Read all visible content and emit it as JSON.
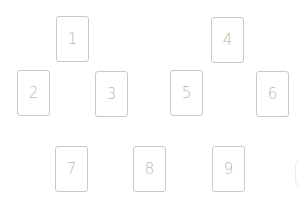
{
  "board": {
    "cards": [
      {
        "label": "1",
        "x": 56,
        "y": 16
      },
      {
        "label": "2",
        "x": 17,
        "y": 70
      },
      {
        "label": "3",
        "x": 95,
        "y": 71
      },
      {
        "label": "4",
        "x": 211,
        "y": 17
      },
      {
        "label": "5",
        "x": 170,
        "y": 70
      },
      {
        "label": "6",
        "x": 256,
        "y": 71
      },
      {
        "label": "7",
        "x": 55,
        "y": 146
      },
      {
        "label": "8",
        "x": 133,
        "y": 146
      },
      {
        "label": "9",
        "x": 212,
        "y": 146
      }
    ]
  },
  "colors": {
    "background": "#ffffff",
    "card_border": "#c9c9c9",
    "card_label": "#b8b8b8"
  }
}
